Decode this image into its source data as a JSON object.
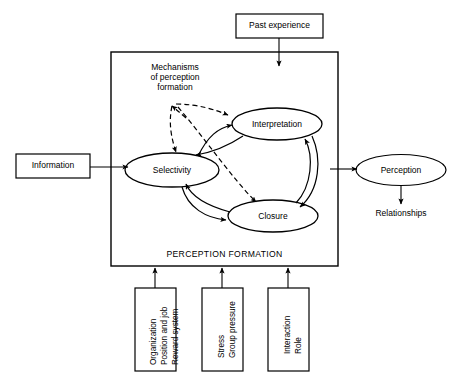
{
  "diagram": {
    "title": "PERCEPTION FORMATION",
    "frame": {
      "caption": "PERCEPTION FORMATION"
    },
    "inputs": {
      "information": "Information",
      "past_experience": "Past experience"
    },
    "mechanisms": {
      "line1": "Mechanisms",
      "line2": "of perception",
      "line3": "formation",
      "full": "Mechanisms of perception formation"
    },
    "processes": {
      "selectivity": "Selectivity",
      "interpretation": "Interpretation",
      "closure": "Closure"
    },
    "outputs": {
      "perception": "Perception",
      "relationships": "Relationships"
    },
    "influence_boxes": [
      {
        "id": "organization",
        "lines": [
          "Organization",
          "Position and job",
          "Reward system"
        ]
      },
      {
        "id": "stress",
        "lines": [
          "Stress",
          "Group pressure"
        ]
      },
      {
        "id": "interaction",
        "lines": [
          "Interaction",
          "Role"
        ]
      }
    ],
    "colors": {
      "stroke": "#000000",
      "background": "#ffffff",
      "text": "#000000"
    }
  }
}
